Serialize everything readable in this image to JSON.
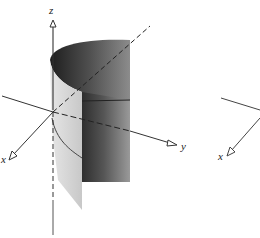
{
  "figure": {
    "left": {
      "axes": {
        "z_label": "z",
        "x_label": "x",
        "y_label": "y"
      },
      "surface": "parabolic cylinder"
    },
    "right": {
      "axes": {
        "x_label": "x"
      }
    }
  },
  "colors": {
    "axis": "#333333",
    "surface_dark": "#3a3a3a",
    "surface_mid": "#8a8a8a",
    "surface_light": "#d6d6d6",
    "background": "#ffffff"
  }
}
